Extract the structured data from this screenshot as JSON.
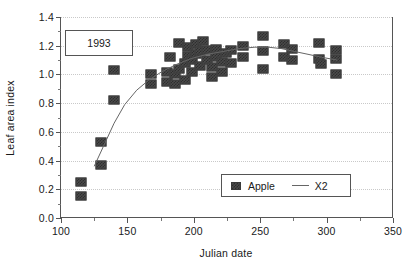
{
  "annotation": {
    "year_label": "1993"
  },
  "legend": {
    "entries": [
      {
        "label": "Apple",
        "marker": "filled-square",
        "color": "#4a4a4a"
      },
      {
        "label": "X2",
        "marker": "line",
        "color": "#666666"
      }
    ]
  },
  "chart_data": {
    "type": "scatter",
    "title": "",
    "xlabel": "Julian date",
    "ylabel": "Leaf area index",
    "xlim": [
      100,
      350
    ],
    "ylim": [
      0.0,
      1.4
    ],
    "xticks": [
      100,
      150,
      200,
      250,
      300,
      350
    ],
    "xtick_labels": [
      "100",
      "150",
      "200",
      "250",
      "300",
      "350"
    ],
    "xminor_ticks": [
      125,
      175,
      225,
      275,
      325
    ],
    "yticks": [
      0.0,
      0.2,
      0.4,
      0.6,
      0.8,
      1.0,
      1.2,
      1.4
    ],
    "ytick_labels": [
      "0.0",
      "0.2",
      "0.4",
      "0.6",
      "0.8",
      "1.0",
      "1.2",
      "1.4"
    ],
    "yminor_ticks": [
      0.1,
      0.3,
      0.5,
      0.7,
      0.9,
      1.1,
      1.3
    ],
    "grid": "horizontal-dotted",
    "legend_position": "lower-right",
    "series": [
      {
        "name": "Apple",
        "type": "scatter",
        "marker": "filled-square",
        "color": "#4a4a4a",
        "points": [
          [
            115,
            0.15
          ],
          [
            115,
            0.25
          ],
          [
            130,
            0.37
          ],
          [
            130,
            0.53
          ],
          [
            140,
            0.82
          ],
          [
            140,
            1.03
          ],
          [
            168,
            0.93
          ],
          [
            168,
            1.0
          ],
          [
            180,
            0.95
          ],
          [
            180,
            1.02
          ],
          [
            182,
            1.12
          ],
          [
            186,
            0.93
          ],
          [
            186,
            1.0
          ],
          [
            189,
            1.04
          ],
          [
            189,
            1.22
          ],
          [
            193,
            0.96
          ],
          [
            193,
            1.08
          ],
          [
            196,
            1.13
          ],
          [
            196,
            1.19
          ],
          [
            199,
            1.02
          ],
          [
            199,
            1.1
          ],
          [
            202,
            1.14
          ],
          [
            202,
            1.21
          ],
          [
            205,
            1.06
          ],
          [
            205,
            1.16
          ],
          [
            207,
            1.23
          ],
          [
            210,
            1.1
          ],
          [
            210,
            1.17
          ],
          [
            214,
            0.98
          ],
          [
            214,
            1.05
          ],
          [
            217,
            1.12
          ],
          [
            217,
            1.18
          ],
          [
            221,
            1.02
          ],
          [
            221,
            1.09
          ],
          [
            224,
            1.15
          ],
          [
            228,
            1.08
          ],
          [
            228,
            1.17
          ],
          [
            237,
            1.12
          ],
          [
            237,
            1.2
          ],
          [
            252,
            1.04
          ],
          [
            252,
            1.16
          ],
          [
            252,
            1.27
          ],
          [
            268,
            1.12
          ],
          [
            268,
            1.21
          ],
          [
            274,
            1.1
          ],
          [
            274,
            1.18
          ],
          [
            294,
            1.11
          ],
          [
            294,
            1.22
          ],
          [
            296,
            1.07
          ],
          [
            307,
            1.0
          ],
          [
            307,
            1.11
          ],
          [
            307,
            1.17
          ]
        ]
      },
      {
        "name": "X2",
        "type": "line",
        "color": "#666666",
        "points": [
          [
            125,
            0.36
          ],
          [
            132,
            0.5
          ],
          [
            140,
            0.66
          ],
          [
            148,
            0.79
          ],
          [
            157,
            0.89
          ],
          [
            166,
            0.96
          ],
          [
            176,
            1.02
          ],
          [
            187,
            1.07
          ],
          [
            198,
            1.11
          ],
          [
            210,
            1.14
          ],
          [
            222,
            1.16
          ],
          [
            234,
            1.18
          ],
          [
            246,
            1.19
          ],
          [
            256,
            1.19
          ],
          [
            266,
            1.18
          ],
          [
            276,
            1.16
          ],
          [
            286,
            1.14
          ],
          [
            296,
            1.12
          ],
          [
            308,
            1.1
          ]
        ]
      }
    ]
  }
}
